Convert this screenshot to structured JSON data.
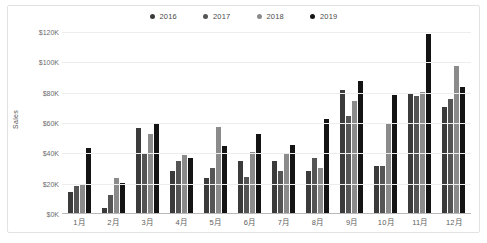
{
  "chart_data": {
    "type": "bar",
    "title": "",
    "xlabel": "",
    "ylabel": "Sales",
    "ylim": [
      0,
      120000
    ],
    "grid": true,
    "legend_position": "top-center",
    "tick_format": "$#K",
    "categories": [
      "1月",
      "2月",
      "3月",
      "4月",
      "5月",
      "6月",
      "7月",
      "8月",
      "9月",
      "10月",
      "11月",
      "12月"
    ],
    "ytick_labels": [
      "$120K",
      "$100K",
      "$80K",
      "$60K",
      "$40K",
      "$20K",
      "$0K"
    ],
    "ytick_values": [
      120000,
      100000,
      80000,
      60000,
      40000,
      20000,
      0
    ],
    "series": [
      {
        "name": "2016",
        "color": "#3b3b3b",
        "values": [
          14000,
          3000,
          56000,
          28000,
          23000,
          34000,
          34000,
          28000,
          81000,
          31000,
          79000,
          70000
        ]
      },
      {
        "name": "2017",
        "color": "#555555",
        "values": [
          18000,
          12000,
          39000,
          34000,
          30000,
          24000,
          28000,
          36000,
          64000,
          31000,
          77000,
          75000
        ]
      },
      {
        "name": "2018",
        "color": "#8b8b8b",
        "values": [
          19000,
          23000,
          52000,
          38000,
          57000,
          40000,
          39000,
          30000,
          74000,
          59000,
          80000,
          97000
        ]
      },
      {
        "name": "2019",
        "color": "#141414",
        "values": [
          43000,
          20000,
          59000,
          36000,
          44000,
          52000,
          45000,
          62000,
          87000,
          78000,
          118000,
          83000
        ]
      }
    ]
  },
  "theme": {
    "background": "#ffffff",
    "border": "#e2e2e2",
    "gridline": "#ededed",
    "axis_line": "#b9b9b9",
    "tick_text": "#6b6b6b",
    "legend_text": "#4a4a4a"
  }
}
